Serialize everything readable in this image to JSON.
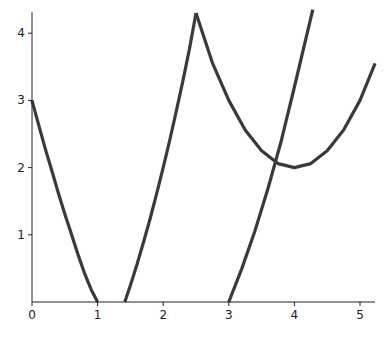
{
  "chart_data": {
    "type": "line",
    "title": "",
    "xlabel": "",
    "ylabel": "",
    "xlim": [
      0,
      5.23
    ],
    "ylim": [
      0,
      4.35
    ],
    "x_ticks": [
      0,
      1,
      2,
      3,
      4,
      5
    ],
    "y_ticks": [
      1,
      2,
      3,
      4
    ],
    "grid": false,
    "legend": null,
    "line_color": "#3a3a3a",
    "series": [
      {
        "name": "curve-1",
        "x": [
          0,
          0.1,
          0.2,
          0.3,
          0.4,
          0.5,
          0.6,
          0.7,
          0.8,
          0.9,
          1.0
        ],
        "y": [
          3.0,
          2.64,
          2.29,
          1.96,
          1.63,
          1.31,
          1.01,
          0.71,
          0.43,
          0.19,
          0.0
        ]
      },
      {
        "name": "curve-2",
        "x": [
          1.414,
          1.5,
          1.6,
          1.7,
          1.8,
          1.9,
          2.0,
          2.1,
          2.2,
          2.3,
          2.4,
          2.5
        ],
        "y": [
          0.0,
          0.25,
          0.56,
          0.89,
          1.24,
          1.61,
          2.0,
          2.41,
          2.84,
          3.29,
          3.76,
          4.3
        ]
      },
      {
        "name": "curve-3",
        "x": [
          2.5,
          2.75,
          3.0,
          3.25,
          3.5,
          3.75,
          4.0,
          4.25,
          4.5,
          4.75,
          5.0,
          5.23
        ],
        "y": [
          4.3,
          3.56,
          3.0,
          2.56,
          2.25,
          2.06,
          2.0,
          2.06,
          2.25,
          2.56,
          3.0,
          3.55
        ]
      },
      {
        "name": "curve-4",
        "x": [
          3.0,
          3.2,
          3.4,
          3.6,
          3.8,
          4.0,
          4.28
        ],
        "y": [
          0.0,
          0.5,
          1.06,
          1.7,
          2.4,
          3.2,
          4.35
        ]
      }
    ]
  }
}
